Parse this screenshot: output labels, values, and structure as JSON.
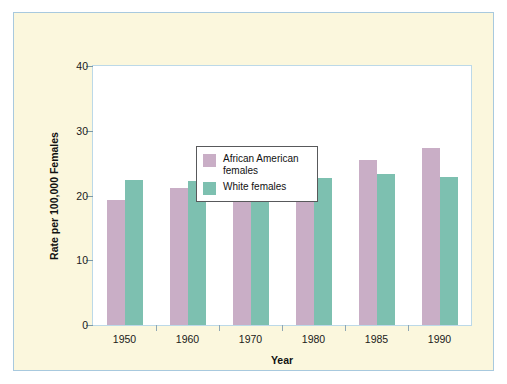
{
  "chart_data": {
    "type": "bar",
    "title": "",
    "subtitle": "",
    "xlabel": "Year",
    "ylabel": "Rate per 100,000 Females",
    "categories": [
      "1950",
      "1960",
      "1970",
      "1980",
      "1985",
      "1990"
    ],
    "ylim": [
      0,
      40
    ],
    "yticks": [
      0,
      10,
      20,
      30,
      40
    ],
    "grid": false,
    "legend_position": "inside-top-left",
    "series": [
      {
        "name": "African American females",
        "color": "#c9aec6",
        "values": [
          19.3,
          21.2,
          21.4,
          23.2,
          25.5,
          27.3
        ]
      },
      {
        "name": "White females",
        "color": "#7dc0b0",
        "values": [
          22.4,
          22.2,
          23.3,
          22.7,
          23.3,
          22.8
        ]
      }
    ],
    "annotations": []
  },
  "figure": {
    "background_color": "#fbf7dd",
    "border_color": "#a8c9de",
    "plot_background_color": "#ffffff",
    "plot_border_color": "#bcd9e8"
  }
}
